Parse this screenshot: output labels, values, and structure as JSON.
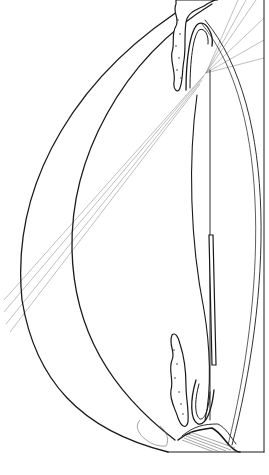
{
  "figure": {
    "labels": [],
    "colors": {
      "ink": "#1a1a1a",
      "light_ink": "#8a8a8a",
      "background": "#ffffff"
    }
  },
  "structures": {
    "cornea_outer": "M 196 0 C 80 70, 10 180, 22 300 C 35 380, 80 430, 168 452",
    "cornea_inner": "M 212 4 C 120 60, 70 160, 72 250 C 74 330, 110 390, 175 440",
    "right_border": "M 264 0 L 264 452",
    "bottom_border": "M 168 452 L 264 452",
    "lens_posterior": "M 205 20 C 280 110, 270 300, 232 445",
    "lens_posterior_inner": "M 202 24 C 274 112, 264 300, 228 445",
    "lens_anterior": "M 197 95 C 188 160, 190 240, 204 310 C 210 345, 212 390, 205 420",
    "lens_center": "M 210 70 L 210 420",
    "zonule_bar": "M 209 235 L 213 235 L 216 365 L 212 365 Z",
    "upper_iris": "M 176 4 C 172 12, 180 18, 176 26 C 171 34, 175 44, 172 52 C 170 62, 176 72, 174 82 C 173 90, 178 94, 180 88 C 183 80, 182 70, 184 60 C 186 48, 184 36, 186 22 C 188 12, 196 10, 204 6 C 210 2, 215 0, 218 0 L 176 0 Z",
    "upper_ciliary_fold": "M 186 90 C 186 60, 190 30, 198 24 C 206 20, 214 34, 212 46",
    "upper_ciliary_fold_inner": "M 190 88 C 190 62, 193 36, 199 30 C 205 27, 209 36, 208 44",
    "lower_iris": "M 172 335 C 168 345, 176 352, 172 360 C 168 370, 174 380, 171 390 C 169 400, 176 410, 178 418 C 181 426, 186 430, 188 422 C 189 410, 186 398, 186 386 C 186 372, 184 356, 180 344 C 178 336, 175 332, 172 335 Z",
    "lower_ciliary_fold": "M 196 380 C 190 400, 190 420, 198 424 C 206 426, 212 410, 214 390",
    "lower_ciliary_fold_inner": "M 199 384 C 194 402, 195 416, 200 419 C 205 420, 209 408, 210 392",
    "angle_tissue": "M 178 440 C 190 430, 200 430, 212 428 C 220 432, 224 440, 230 446 C 234 450, 238 452, 240 452",
    "angle_tissue_2": "M 182 436 C 194 426, 204 424, 218 424 C 226 428, 230 436, 236 444",
    "angle_fan": [
      "M 182 440 L 214 452",
      "M 184 438 L 220 452",
      "M 186 436 L 226 451",
      "M 188 434 L 231 450",
      "M 190 432 L 235 448"
    ],
    "trabecular_loop": "M 140 420 C 130 430, 150 448, 166 446 C 170 440, 166 430, 160 426"
  },
  "rays": {
    "upper_fan_origin": [
      206,
      73
    ],
    "upper_fan_targets": [
      [
        238,
        0
      ],
      [
        246,
        0
      ],
      [
        256,
        0
      ],
      [
        264,
        18
      ],
      [
        264,
        40
      ],
      [
        264,
        58
      ]
    ],
    "oblique_bundle": [
      [
        "M 206 73 L 4 300"
      ],
      [
        "M 204 76 L 4 312"
      ],
      [
        "M 202 80 L 6 324"
      ],
      [
        "M 200 84 L 10 332"
      ]
    ]
  }
}
